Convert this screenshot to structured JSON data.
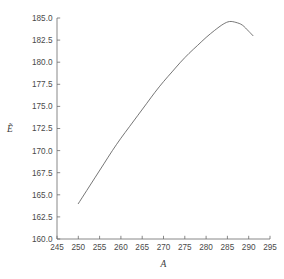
{
  "chart_data": {
    "type": "line",
    "title": "",
    "subtitle": "",
    "xlabel": "A",
    "ylabel": "Ẽ",
    "xlim": [
      245,
      295
    ],
    "ylim": [
      160.0,
      185.0
    ],
    "grid": false,
    "legend": null,
    "legend_position": "none",
    "annotations": [],
    "xticks": [
      245,
      250,
      255,
      260,
      265,
      270,
      275,
      280,
      285,
      290,
      295
    ],
    "xtick_labels": [
      "245",
      "250",
      "255",
      "260",
      "265",
      "270",
      "275",
      "280",
      "285",
      "290",
      "295"
    ],
    "yticks": [
      160.0,
      162.5,
      165.0,
      167.5,
      170.0,
      172.5,
      175.0,
      177.5,
      180.0,
      182.5,
      185.0
    ],
    "ytick_labels": [
      "160.0",
      "162.5",
      "165.0",
      "167.5",
      "170.0",
      "172.5",
      "175.0",
      "177.5",
      "180.0",
      "182.5",
      "185.0"
    ],
    "series": [
      {
        "name": "curve",
        "color": "#5d5d5d",
        "x": [
          250.0,
          252.0,
          254.0,
          256.0,
          258.0,
          260.0,
          262.0,
          264.0,
          266.0,
          268.0,
          270.0,
          272.0,
          274.0,
          276.0,
          278.0,
          280.0,
          282.0,
          284.0,
          285.5,
          287.0,
          288.5,
          290.0,
          291.0
        ],
        "y": [
          164.0,
          165.5,
          167.0,
          168.5,
          170.0,
          171.4,
          172.7,
          174.0,
          175.3,
          176.6,
          177.8,
          178.9,
          180.0,
          181.0,
          181.9,
          182.8,
          183.6,
          184.3,
          184.6,
          184.5,
          184.2,
          183.5,
          183.0
        ]
      }
    ]
  }
}
